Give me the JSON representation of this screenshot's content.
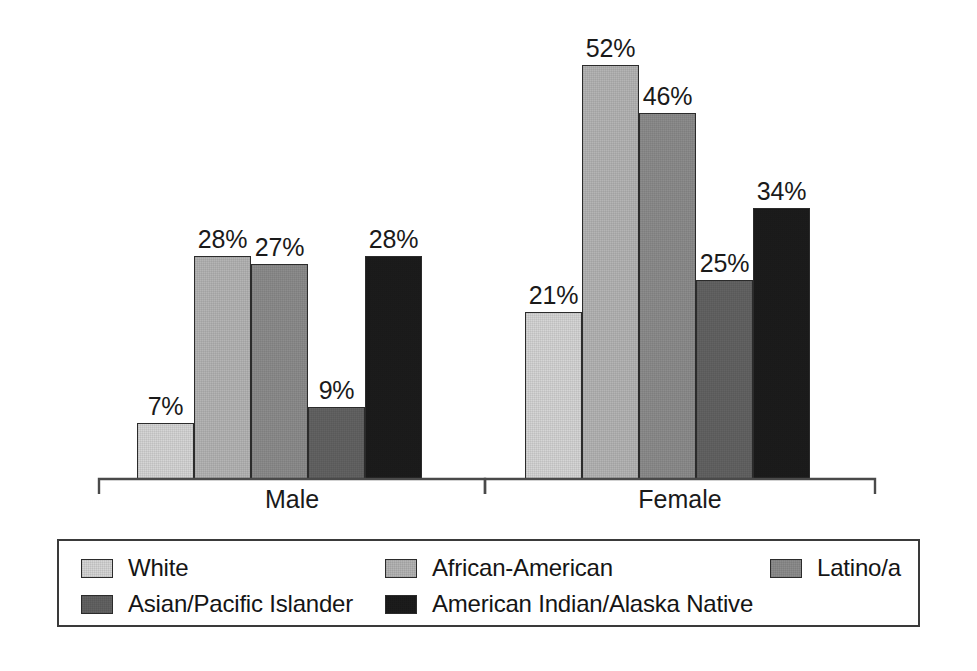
{
  "chart_data": {
    "type": "bar",
    "title": "",
    "subtitle": "",
    "xlabel": "",
    "ylabel": "",
    "ylim": [
      0,
      55
    ],
    "grid": false,
    "legend_position": "bottom",
    "value_label_suffix": "%",
    "categories": [
      "Male",
      "Female"
    ],
    "series": [
      {
        "name": "White",
        "color": "#d6d6d6",
        "values": [
          7,
          21
        ],
        "labels": [
          "7%",
          "21%"
        ]
      },
      {
        "name": "African-American",
        "color": "#b5b5b5",
        "values": [
          28,
          52
        ],
        "labels": [
          "28%",
          "52%"
        ]
      },
      {
        "name": "Latino/a",
        "color": "#8d8d8d",
        "values": [
          27,
          46
        ],
        "labels": [
          "27%",
          "46%"
        ]
      },
      {
        "name": "Asian/Pacific Islander",
        "color": "#636363",
        "values": [
          9,
          25
        ],
        "labels": [
          "9%",
          "25%"
        ]
      },
      {
        "name": "American Indian/Alaska Native",
        "color": "#1c1c1c",
        "values": [
          28,
          34
        ],
        "labels": [
          "28%",
          "34%"
        ]
      }
    ]
  },
  "axis": {
    "baseline_color": "#4a4a4a",
    "group_labels": [
      "Male",
      "Female"
    ]
  },
  "legend": {
    "border_color": "#3a3a3a",
    "items": [
      {
        "label": "White",
        "color": "#d6d6d6"
      },
      {
        "label": "African-American",
        "color": "#b5b5b5"
      },
      {
        "label": "Latino/a",
        "color": "#8d8d8d"
      },
      {
        "label": "Asian/Pacific Islander",
        "color": "#636363"
      },
      {
        "label": "American Indian/Alaska Native",
        "color": "#1c1c1c"
      }
    ]
  }
}
